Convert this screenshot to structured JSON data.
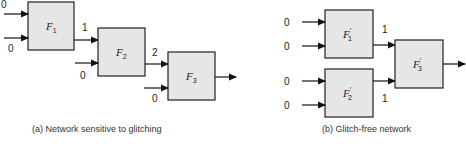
{
  "diagram_a": {
    "caption": "(a) Network sensitive to glitching",
    "blocks": [
      {
        "name": "F",
        "sub": "1",
        "prime": ""
      },
      {
        "name": "F",
        "sub": "2",
        "prime": ""
      },
      {
        "name": "F",
        "sub": "3",
        "prime": ""
      }
    ],
    "values": {
      "f1_in_top": "0",
      "f1_in_bottom": "0",
      "f1_out": "1",
      "f2_in_bottom": "0",
      "f2_out": "2",
      "f3_in_bottom": "0"
    }
  },
  "diagram_b": {
    "caption": "(b) Glitch-free network",
    "blocks": [
      {
        "name": "F",
        "sub": "1",
        "prime": "′"
      },
      {
        "name": "F",
        "sub": "2",
        "prime": "′"
      },
      {
        "name": "F",
        "sub": "3",
        "prime": "′"
      }
    ],
    "values": {
      "f1_in_top": "0",
      "f1_in_bottom": "0",
      "f2_in_top": "0",
      "f2_in_bottom": "0",
      "f1_out": "1",
      "f2_out": "1"
    }
  },
  "colors": {
    "block_fill": "#e6e6e6",
    "stroke": "#111111"
  }
}
